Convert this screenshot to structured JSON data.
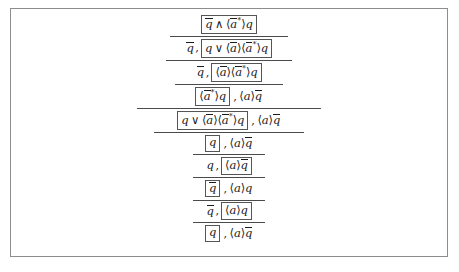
{
  "figure": {
    "kind": "proof-derivation",
    "notation": "modal-mu-calculus-focused-sequent",
    "frame_color": "#8d8d8d",
    "rule_color": "#4a4a4a",
    "box_border_color": "#555555",
    "text_color": "#1a1a1a",
    "background": "#ffffff",
    "symbols": {
      "and": "∧",
      "or": "∨",
      "angle_open": "⟨",
      "angle_close": "⟩",
      "star": "*",
      "comma": ","
    },
    "steps": [
      {
        "index": 1,
        "rule_above": false,
        "rule_width_px": 0,
        "left": "",
        "box": "q̄ ∧ ⟨ā*⟩q",
        "right": "",
        "box_parts": [
          {
            "t": "bar",
            "v": "q"
          },
          {
            "t": "op",
            "v": "∧"
          },
          {
            "t": "angle",
            "v": "⟨"
          },
          {
            "t": "barstar",
            "v": "a"
          },
          {
            "t": "angle",
            "v": "⟩"
          },
          {
            "t": "var",
            "v": "q"
          }
        ],
        "left_parts": [],
        "right_parts": []
      },
      {
        "index": 2,
        "rule_above": true,
        "rule_width_px": 118,
        "left": "q̄,",
        "box": "q ∨ ⟨ā⟩⟨ā*⟩q",
        "right": "",
        "left_parts": [
          {
            "t": "bar",
            "v": "q"
          }
        ],
        "box_parts": [
          {
            "t": "var",
            "v": "q"
          },
          {
            "t": "op",
            "v": "∨"
          },
          {
            "t": "angle",
            "v": "⟨"
          },
          {
            "t": "bar",
            "v": "a"
          },
          {
            "t": "angle",
            "v": "⟩"
          },
          {
            "t": "angle",
            "v": "⟨"
          },
          {
            "t": "barstar",
            "v": "a"
          },
          {
            "t": "angle",
            "v": "⟩"
          },
          {
            "t": "var",
            "v": "q"
          }
        ],
        "right_parts": []
      },
      {
        "index": 3,
        "rule_above": true,
        "rule_width_px": 126,
        "left": "q̄,",
        "box": "⟨ā⟩⟨ā*⟩q",
        "right": "",
        "left_parts": [
          {
            "t": "bar",
            "v": "q"
          }
        ],
        "box_parts": [
          {
            "t": "angle",
            "v": "⟨"
          },
          {
            "t": "bar",
            "v": "a"
          },
          {
            "t": "angle",
            "v": "⟩"
          },
          {
            "t": "angle",
            "v": "⟨"
          },
          {
            "t": "barstar",
            "v": "a"
          },
          {
            "t": "angle",
            "v": "⟩"
          },
          {
            "t": "var",
            "v": "q"
          }
        ],
        "right_parts": []
      },
      {
        "index": 4,
        "rule_above": true,
        "rule_width_px": 108,
        "left": "",
        "box": "⟨ā*⟩q",
        "right": ", ⟨a⟩q̄",
        "left_parts": [],
        "box_parts": [
          {
            "t": "angle",
            "v": "⟨"
          },
          {
            "t": "barstar",
            "v": "a"
          },
          {
            "t": "angle",
            "v": "⟩"
          },
          {
            "t": "var",
            "v": "q"
          }
        ],
        "right_parts": [
          {
            "t": "angle",
            "v": "⟨"
          },
          {
            "t": "var",
            "v": "a"
          },
          {
            "t": "angle",
            "v": "⟩"
          },
          {
            "t": "bar",
            "v": "q"
          }
        ]
      },
      {
        "index": 5,
        "rule_above": true,
        "rule_width_px": 184,
        "left": "",
        "box": "q ∨ ⟨ā⟩⟨ā*⟩q",
        "right": ", ⟨a⟩q̄",
        "left_parts": [],
        "box_parts": [
          {
            "t": "var",
            "v": "q"
          },
          {
            "t": "op",
            "v": "∨"
          },
          {
            "t": "angle",
            "v": "⟨"
          },
          {
            "t": "bar",
            "v": "a"
          },
          {
            "t": "angle",
            "v": "⟩"
          },
          {
            "t": "angle",
            "v": "⟨"
          },
          {
            "t": "barstar",
            "v": "a"
          },
          {
            "t": "angle",
            "v": "⟩"
          },
          {
            "t": "var",
            "v": "q"
          }
        ],
        "right_parts": [
          {
            "t": "angle",
            "v": "⟨"
          },
          {
            "t": "var",
            "v": "a"
          },
          {
            "t": "angle",
            "v": "⟩"
          },
          {
            "t": "bar",
            "v": "q"
          }
        ]
      },
      {
        "index": 6,
        "rule_above": true,
        "rule_width_px": 150,
        "left": "",
        "box": "q",
        "right": ", ⟨a⟩q̄",
        "left_parts": [],
        "box_parts": [
          {
            "t": "var",
            "v": "q"
          }
        ],
        "right_parts": [
          {
            "t": "angle",
            "v": "⟨"
          },
          {
            "t": "var",
            "v": "a"
          },
          {
            "t": "angle",
            "v": "⟩"
          },
          {
            "t": "bar",
            "v": "q"
          }
        ]
      },
      {
        "index": 7,
        "rule_above": true,
        "rule_width_px": 72,
        "left": "q,",
        "box": "⟨a⟩q̄",
        "right": "",
        "left_parts": [
          {
            "t": "var",
            "v": "q"
          }
        ],
        "box_parts": [
          {
            "t": "angle",
            "v": "⟨"
          },
          {
            "t": "var",
            "v": "a"
          },
          {
            "t": "angle",
            "v": "⟩"
          },
          {
            "t": "bar",
            "v": "q"
          }
        ],
        "right_parts": []
      },
      {
        "index": 8,
        "rule_above": true,
        "rule_width_px": 72,
        "left": "",
        "box": "q̄",
        "right": ", ⟨a⟩q",
        "left_parts": [],
        "box_parts": [
          {
            "t": "bar",
            "v": "q"
          }
        ],
        "right_parts": [
          {
            "t": "angle",
            "v": "⟨"
          },
          {
            "t": "var",
            "v": "a"
          },
          {
            "t": "angle",
            "v": "⟩"
          },
          {
            "t": "var",
            "v": "q"
          }
        ]
      },
      {
        "index": 9,
        "rule_above": true,
        "rule_width_px": 72,
        "left": "q̄,",
        "box": "⟨a⟩q",
        "right": "",
        "left_parts": [
          {
            "t": "bar",
            "v": "q"
          }
        ],
        "box_parts": [
          {
            "t": "angle",
            "v": "⟨"
          },
          {
            "t": "var",
            "v": "a"
          },
          {
            "t": "angle",
            "v": "⟩"
          },
          {
            "t": "var",
            "v": "q"
          }
        ],
        "right_parts": []
      },
      {
        "index": 10,
        "rule_above": true,
        "rule_width_px": 72,
        "left": "",
        "box": "q",
        "right": ", ⟨a⟩q̄",
        "left_parts": [],
        "box_parts": [
          {
            "t": "var",
            "v": "q"
          }
        ],
        "right_parts": [
          {
            "t": "angle",
            "v": "⟨"
          },
          {
            "t": "var",
            "v": "a"
          },
          {
            "t": "angle",
            "v": "⟩"
          },
          {
            "t": "bar",
            "v": "q"
          }
        ]
      }
    ]
  }
}
